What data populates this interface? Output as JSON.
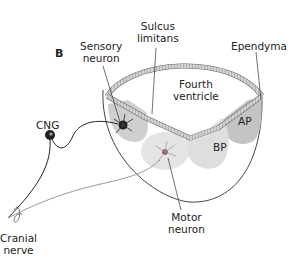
{
  "panel_label": "B",
  "labels": {
    "sensory_neuron": [
      "Sensory",
      "neuron"
    ],
    "sulcus_limitans": [
      "Sulcus",
      "limitans"
    ],
    "ependyma": "Ependyma",
    "fourth_ventricle": [
      "Fourth",
      "ventricle"
    ],
    "cng": "CNG",
    "ap": "AP",
    "bp": "BP",
    "motor_neuron": [
      "Motor",
      "neuron"
    ],
    "cranial_nerve": [
      "Cranial",
      "nerve"
    ]
  },
  "colors": {
    "ap_fill": "#c4c4c4",
    "bp_fill": "#dcdcdc",
    "sensory_fill": "#cfcfcf",
    "motor_fill": "#e2e2e2",
    "ependyma_fill": "#cfcfcf",
    "line": "#333333",
    "grey_line": "#9a9a9a"
  }
}
